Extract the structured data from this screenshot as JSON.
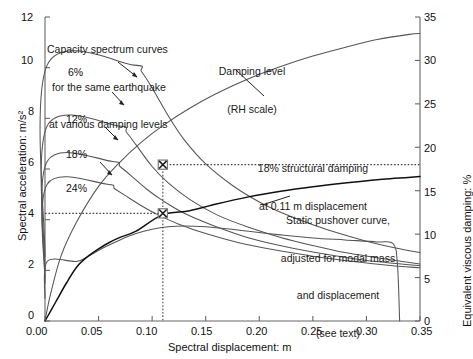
{
  "chart_data": {
    "type": "line",
    "title": "",
    "xlabel": "Spectral displacement: m",
    "ylabel": "Spectral acceleration: m/s²",
    "y2label": "Equivalent viscous damping: %",
    "xlim": [
      0.0,
      0.35
    ],
    "ylim": [
      0,
      12
    ],
    "y2lim": [
      0,
      35
    ],
    "grid": false,
    "legend_position": "none",
    "xticks": [
      "0.00",
      "0.05",
      "0.10",
      "0.15",
      "0.20",
      "0.25",
      "0.30",
      "0.35"
    ],
    "xtick_values": [
      0.0,
      0.05,
      0.1,
      0.15,
      0.2,
      0.25,
      0.3,
      0.35
    ],
    "yticks": [
      "0",
      "2",
      "4",
      "6",
      "8",
      "10",
      "12"
    ],
    "ytick_values": [
      0,
      2,
      4,
      6,
      8,
      10,
      12
    ],
    "y2ticks": [
      "0",
      "5",
      "10",
      "15",
      "20",
      "25",
      "30",
      "35"
    ],
    "y2tick_values": [
      0,
      5,
      10,
      15,
      20,
      25,
      30,
      35
    ],
    "series": [
      {
        "name": "6% damping capacity spectrum",
        "axis": "left",
        "label": "6%",
        "plateau_value": 10.1,
        "plateau_end_x": 0.083,
        "points": [
          [
            0.0,
            2.55
          ],
          [
            0.002,
            10.1
          ],
          [
            0.083,
            10.1
          ],
          [
            0.09,
            9.85
          ],
          [
            0.1,
            9.2
          ],
          [
            0.115,
            8.1
          ],
          [
            0.13,
            7.15
          ],
          [
            0.15,
            6.2
          ],
          [
            0.175,
            5.35
          ],
          [
            0.2,
            4.7
          ],
          [
            0.225,
            4.2
          ],
          [
            0.25,
            3.8
          ],
          [
            0.275,
            3.45
          ],
          [
            0.3,
            3.15
          ],
          [
            0.325,
            2.9
          ],
          [
            0.35,
            2.7
          ]
        ]
      },
      {
        "name": "12% damping capacity spectrum",
        "axis": "left",
        "label": "12%",
        "plateau_value": 7.7,
        "plateau_end_x": 0.069,
        "points": [
          [
            0.0,
            2.0
          ],
          [
            0.002,
            7.7
          ],
          [
            0.069,
            7.7
          ],
          [
            0.076,
            7.45
          ],
          [
            0.085,
            6.95
          ],
          [
            0.1,
            6.1
          ],
          [
            0.115,
            5.45
          ],
          [
            0.135,
            4.8
          ],
          [
            0.16,
            4.2
          ],
          [
            0.19,
            3.7
          ],
          [
            0.22,
            3.3
          ],
          [
            0.25,
            2.98
          ],
          [
            0.28,
            2.7
          ],
          [
            0.31,
            2.5
          ],
          [
            0.35,
            2.25
          ]
        ]
      },
      {
        "name": "18% damping capacity spectrum",
        "axis": "left",
        "label": "18%",
        "plateau_value": 6.3,
        "plateau_end_x": 0.063,
        "points": [
          [
            0.0,
            1.7
          ],
          [
            0.002,
            6.3
          ],
          [
            0.063,
            6.3
          ],
          [
            0.07,
            6.1
          ],
          [
            0.08,
            5.75
          ],
          [
            0.095,
            5.2
          ],
          [
            0.11,
            4.75
          ],
          [
            0.13,
            4.25
          ],
          [
            0.155,
            3.8
          ],
          [
            0.185,
            3.35
          ],
          [
            0.215,
            3.02
          ],
          [
            0.25,
            2.72
          ],
          [
            0.29,
            2.45
          ],
          [
            0.32,
            2.3
          ],
          [
            0.35,
            2.18
          ]
        ]
      },
      {
        "name": "24% damping capacity spectrum",
        "axis": "left",
        "label": "24%",
        "plateau_value": 5.4,
        "plateau_end_x": 0.058,
        "points": [
          [
            0.0,
            1.5
          ],
          [
            0.002,
            5.4
          ],
          [
            0.058,
            5.4
          ],
          [
            0.065,
            5.22
          ],
          [
            0.075,
            4.95
          ],
          [
            0.09,
            4.55
          ],
          [
            0.105,
            4.2
          ],
          [
            0.125,
            3.82
          ],
          [
            0.15,
            3.45
          ],
          [
            0.18,
            3.1
          ],
          [
            0.215,
            2.8
          ],
          [
            0.25,
            2.56
          ],
          [
            0.29,
            2.34
          ],
          [
            0.32,
            2.2
          ],
          [
            0.35,
            2.1
          ]
        ]
      },
      {
        "name": "low-level capacity spectrum",
        "axis": "left",
        "label": "",
        "plateau_value": 2.35,
        "plateau_end_x": 0.029,
        "points": [
          [
            0.0,
            0.9
          ],
          [
            0.002,
            2.35
          ],
          [
            0.029,
            2.35
          ],
          [
            0.04,
            2.55
          ],
          [
            0.055,
            2.9
          ],
          [
            0.07,
            3.2
          ],
          [
            0.085,
            3.45
          ],
          [
            0.1,
            3.62
          ],
          [
            0.115,
            3.72
          ],
          [
            0.13,
            3.75
          ],
          [
            0.15,
            3.72
          ],
          [
            0.17,
            3.64
          ],
          [
            0.19,
            3.54
          ],
          [
            0.22,
            3.4
          ],
          [
            0.25,
            3.28
          ],
          [
            0.28,
            3.2
          ],
          [
            0.31,
            3.12
          ],
          [
            0.325,
            3.05
          ],
          [
            0.329,
            2.2
          ],
          [
            0.331,
            0.0
          ]
        ]
      },
      {
        "name": "Static pushover curve",
        "axis": "left",
        "label": "Static pushover curve",
        "points": [
          [
            0.0,
            0.0
          ],
          [
            0.01,
            0.75
          ],
          [
            0.02,
            1.5
          ],
          [
            0.03,
            2.15
          ],
          [
            0.04,
            2.55
          ],
          [
            0.05,
            2.85
          ],
          [
            0.06,
            3.1
          ],
          [
            0.07,
            3.3
          ],
          [
            0.085,
            3.55
          ],
          [
            0.11,
            4.2
          ],
          [
            0.135,
            4.35
          ],
          [
            0.16,
            4.62
          ],
          [
            0.19,
            4.9
          ],
          [
            0.22,
            5.12
          ],
          [
            0.25,
            5.3
          ],
          [
            0.28,
            5.45
          ],
          [
            0.31,
            5.58
          ],
          [
            0.35,
            5.7
          ]
        ]
      },
      {
        "name": "Damping level",
        "axis": "right",
        "label": "Damping level (RH scale)",
        "points": [
          [
            0.0,
            0.0
          ],
          [
            0.005,
            3.0
          ],
          [
            0.015,
            7.5
          ],
          [
            0.03,
            11.5
          ],
          [
            0.05,
            15.5
          ],
          [
            0.07,
            18.3
          ],
          [
            0.09,
            20.6
          ],
          [
            0.11,
            22.5
          ],
          [
            0.135,
            24.5
          ],
          [
            0.16,
            26.2
          ],
          [
            0.19,
            27.9
          ],
          [
            0.22,
            29.3
          ],
          [
            0.25,
            30.5
          ],
          [
            0.28,
            31.5
          ],
          [
            0.31,
            32.4
          ],
          [
            0.34,
            33.0
          ],
          [
            0.35,
            33.1
          ]
        ]
      }
    ],
    "markers": [
      {
        "name": "damping-performance-point",
        "x": 0.11,
        "y_right": 18.0,
        "style": "x-box"
      },
      {
        "name": "capacity-demand-performance-point",
        "x": 0.11,
        "y_left": 4.25,
        "style": "x-box"
      }
    ],
    "guides": [
      {
        "name": "vertical-guide-0.11",
        "type": "vertical",
        "x": 0.11,
        "style": "dotted"
      },
      {
        "name": "horizontal-guide-18pct",
        "type": "horizontal",
        "y_right": 18.0,
        "style": "dotted"
      },
      {
        "name": "horizontal-guide-4.25",
        "type": "horizontal",
        "y_left": 4.25,
        "style": "dotted"
      }
    ],
    "annotations": [
      {
        "name": "capacity-spectrum-note",
        "text": "Capacity spectrum curves\nfor the same earthquake\nat various damping levels"
      },
      {
        "name": "damping-level-note",
        "text": "Damping level\n(RH scale)"
      },
      {
        "name": "structural-damping-note",
        "text": "18% structural damping\nat 0.11 m displacement"
      },
      {
        "name": "pushover-note",
        "text": "Static pushover curve,\nadjusted for modal mass\nand displacement\n(see text)"
      }
    ],
    "curve_labels": [
      "6%",
      "12%",
      "18%",
      "24%"
    ],
    "colors": {
      "axis": "#666666",
      "curve": "#555555",
      "pushover": "#111111",
      "guide": "#444444",
      "text": "#111111"
    }
  },
  "axes": {
    "x_title": "Spectral displacement: m",
    "y_left_title": "Spectral acceleration: m/s²",
    "y_right_title": "Equivalent viscous damping: %"
  },
  "labels": {
    "d6": "6%",
    "d12": "12%",
    "d18": "18%",
    "d24": "24%",
    "note_capacity_1": "Capacity spectrum curves",
    "note_capacity_2": "for the same earthquake",
    "note_capacity_3": "at various damping levels",
    "note_damping_1": "Damping level",
    "note_damping_2": "(RH scale)",
    "note_struct_1": "18% structural damping",
    "note_struct_2": "at 0.11 m displacement",
    "note_push_1": "Static pushover curve,",
    "note_push_2": "adjusted for modal mass",
    "note_push_3": "and displacement",
    "note_push_4": "(see text)"
  },
  "xtick_labels": {
    "t0": "0.00",
    "t1": "0.05",
    "t2": "0.10",
    "t3": "0.15",
    "t4": "0.20",
    "t5": "0.25",
    "t6": "0.30",
    "t7": "0.35"
  },
  "ytick_labels": {
    "l0": "0",
    "l1": "2",
    "l2": "4",
    "l3": "6",
    "l4": "8",
    "l5": "10",
    "l6": "12"
  },
  "y2tick_labels": {
    "r0": "0",
    "r1": "5",
    "r2": "10",
    "r3": "15",
    "r4": "20",
    "r5": "25",
    "r6": "30",
    "r7": "35"
  }
}
